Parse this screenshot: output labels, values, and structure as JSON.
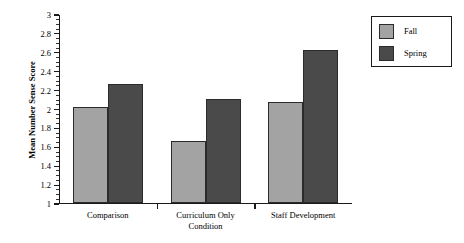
{
  "chart_data": {
    "type": "bar",
    "title": "",
    "xlabel": "Condition",
    "ylabel": "Mean Number Sense Score",
    "categories": [
      "Comparison",
      "Curriculum Only",
      "Staff Development"
    ],
    "series": [
      {
        "name": "Fall",
        "values": [
          2.01,
          1.65,
          2.06
        ],
        "color": "#a3a3a3"
      },
      {
        "name": "Spring",
        "values": [
          2.26,
          2.1,
          2.62
        ],
        "color": "#4a4a4a"
      }
    ],
    "ylim": [
      1,
      3
    ],
    "ytick_labels": [
      "1",
      "1.2",
      "1.4",
      "1.6",
      "1.8",
      "2",
      "2.2",
      "2.4",
      "2.6",
      "2.8",
      "3"
    ],
    "ytick_values": [
      1,
      1.2,
      1.4,
      1.6,
      1.8,
      2,
      2.2,
      2.4,
      2.6,
      2.8,
      3
    ],
    "minor_tick_step": 0.05,
    "grid": false,
    "legend_position": "right",
    "legend_entries": [
      "Fall",
      "Spring"
    ]
  }
}
